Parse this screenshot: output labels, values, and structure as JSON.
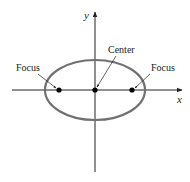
{
  "diagram": {
    "labels": {
      "focus_left": "Focus",
      "focus_right": "Focus",
      "center": "Center",
      "x_axis": "x",
      "y_axis": "y"
    },
    "colors": {
      "ellipse": "#707070",
      "axes": "#222222",
      "points": "#000000"
    },
    "geometry": {
      "center": [
        95,
        90
      ],
      "rx": 50,
      "ry": 30,
      "foci_x": [
        59,
        132
      ]
    }
  }
}
